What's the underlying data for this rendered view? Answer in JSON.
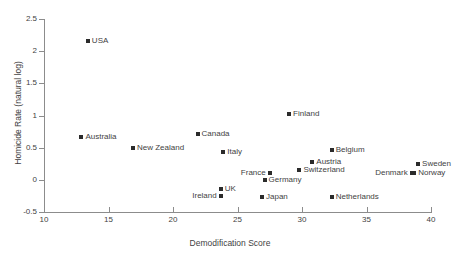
{
  "chart_data": {
    "type": "scatter",
    "title": "",
    "xlabel": "Demodification Score",
    "ylabel": "Homicide Rate (natural log)",
    "xlim": [
      10,
      40
    ],
    "ylim": [
      -0.5,
      2.5
    ],
    "xticks": [
      10,
      15,
      20,
      25,
      30,
      35,
      40
    ],
    "yticks": [
      -0.5,
      0,
      0.5,
      1,
      1.5,
      2,
      2.5
    ],
    "xticklabels": [
      "10",
      "15",
      "20",
      "25",
      "30",
      "35",
      "40"
    ],
    "yticklabels": [
      "-0.5",
      "0",
      "0.5",
      "1",
      "1.5",
      "2",
      "2.5"
    ],
    "grid": false,
    "legend": false,
    "marker": "square",
    "marker_color": "#2b2b2b",
    "points": [
      {
        "label": "USA",
        "x": 13.4,
        "y": 2.16,
        "side": "right"
      },
      {
        "label": "Australia",
        "x": 12.9,
        "y": 0.66,
        "side": "right"
      },
      {
        "label": "New Zealand",
        "x": 16.9,
        "y": 0.5,
        "side": "right"
      },
      {
        "label": "Canada",
        "x": 21.9,
        "y": 0.71,
        "side": "right"
      },
      {
        "label": "Italy",
        "x": 23.9,
        "y": 0.43,
        "side": "right"
      },
      {
        "label": "Finland",
        "x": 29.0,
        "y": 1.03,
        "side": "right"
      },
      {
        "label": "Belgium",
        "x": 32.3,
        "y": 0.47,
        "side": "right"
      },
      {
        "label": "Austria",
        "x": 30.8,
        "y": 0.28,
        "side": "right"
      },
      {
        "label": "Switzerland",
        "x": 29.8,
        "y": 0.15,
        "side": "right"
      },
      {
        "label": "France",
        "x": 27.5,
        "y": 0.11,
        "side": "left"
      },
      {
        "label": "Germany",
        "x": 27.1,
        "y": 0.0,
        "side": "right"
      },
      {
        "label": "Sweden",
        "x": 39.0,
        "y": 0.25,
        "side": "right"
      },
      {
        "label": "Denmark",
        "x": 38.5,
        "y": 0.11,
        "side": "left"
      },
      {
        "label": "Norway",
        "x": 38.7,
        "y": 0.1,
        "side": "right"
      },
      {
        "label": "UK",
        "x": 23.7,
        "y": -0.15,
        "side": "right"
      },
      {
        "label": "Ireland",
        "x": 23.7,
        "y": -0.25,
        "side": "left"
      },
      {
        "label": "Japan",
        "x": 26.9,
        "y": -0.26,
        "side": "right"
      },
      {
        "label": "Netherlands",
        "x": 32.3,
        "y": -0.26,
        "side": "right"
      }
    ]
  }
}
